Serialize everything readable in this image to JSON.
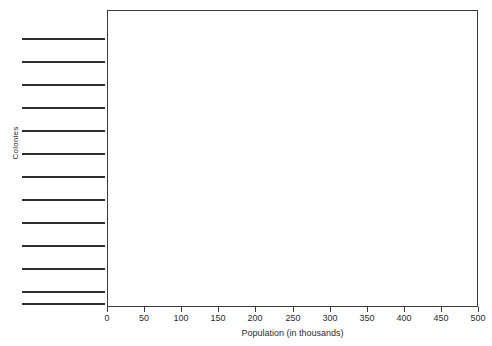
{
  "chart_data": {
    "type": "bar",
    "orientation": "horizontal",
    "title": "",
    "xlabel": "Population (in thousands)",
    "ylabel": "Colonies",
    "xlim": [
      0,
      500
    ],
    "xticks": [
      0,
      50,
      100,
      150,
      200,
      250,
      300,
      350,
      400,
      450,
      500
    ],
    "xtick_labels": [
      "0",
      "50",
      "100",
      "150",
      "200",
      "250",
      "300",
      "350",
      "400",
      "450",
      "500"
    ],
    "grid": false,
    "legend": null,
    "categories": [
      "redacted-category-1",
      "redacted-category-2",
      "redacted-category-3",
      "redacted-category-4",
      "redacted-category-5",
      "redacted-category-6",
      "redacted-category-7",
      "redacted-category-8",
      "redacted-category-9",
      "redacted-category-10",
      "redacted-category-11",
      "redacted-category-12",
      "redacted-category-13"
    ],
    "values": [
      null,
      null,
      null,
      null,
      null,
      null,
      null,
      null,
      null,
      null,
      null,
      null,
      null
    ],
    "note": "Bar values and category label text are redacted; plot interior is blank and each category name is covered by a solid black bar."
  },
  "figure": {
    "title_strip_text": "",
    "category_label_count": 13,
    "category_label_rows_y": [
      38,
      61,
      84,
      107,
      130,
      153,
      176,
      199,
      222,
      245,
      268,
      291,
      303
    ],
    "axis_color": "#3a3a3c",
    "redaction_color": "#2e2e30",
    "background_color": "#ffffff"
  }
}
